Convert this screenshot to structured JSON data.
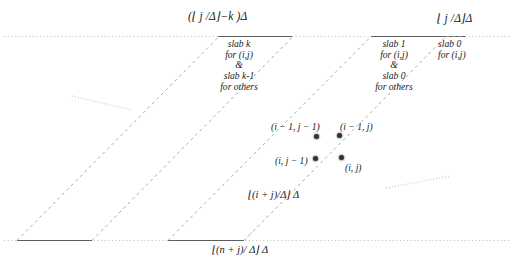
{
  "figure": {
    "kind": "slab-decomposition-diagram",
    "axis_top_labels": [
      {
        "id": "top-left-bound",
        "text": "(⌊ j /Δ⌋−k )Δ"
      },
      {
        "id": "top-right-bound",
        "text": "⌊ j /Δ⌋Δ"
      }
    ],
    "axis_bottom_labels": [
      {
        "id": "bottom-inner-bound",
        "text": "⌊(i + j)/Δ⌋ Δ"
      },
      {
        "id": "bottom-outer-bound",
        "text": "⌊(n + j)/ Δ⌋ Δ"
      }
    ],
    "slab_blocks": [
      {
        "id": "slab-k-block",
        "lines": [
          "slab k",
          "for (i,j)",
          "&",
          "slab k-1",
          "for others"
        ]
      },
      {
        "id": "slab-1-block",
        "lines": [
          "slab 1",
          "for (i,j)",
          "&",
          "slab 0",
          "for others"
        ]
      },
      {
        "id": "slab-0-block",
        "lines": [
          "slab 0",
          "for (i,j)"
        ]
      }
    ],
    "points": [
      {
        "id": "pt-im1-jm1",
        "label": "(i − 1, j − 1)"
      },
      {
        "id": "pt-im1-j",
        "label": "(i − 1, j)"
      },
      {
        "id": "pt-i-jm1",
        "label": "(i, j − 1)"
      },
      {
        "id": "pt-i-j",
        "label": "(i, j)"
      }
    ],
    "colors": {
      "ink": "#1a1a1a",
      "rule": "#6b6b6b",
      "dashed": "#9a9a9a",
      "faint": "#c9c9c9"
    }
  }
}
